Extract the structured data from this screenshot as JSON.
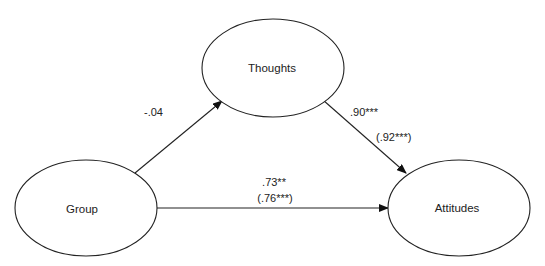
{
  "diagram": {
    "type": "path-mediation-model",
    "nodes": [
      {
        "id": "thoughts",
        "label": "Thoughts",
        "cx": 273,
        "cy": 68,
        "rx": 71,
        "ry": 49
      },
      {
        "id": "group",
        "label": "Group",
        "cx": 86,
        "cy": 208,
        "rx": 71,
        "ry": 48
      },
      {
        "id": "attitudes",
        "label": "Attitudes",
        "cx": 459,
        "cy": 208,
        "rx": 71,
        "ry": 48
      }
    ],
    "edges": [
      {
        "id": "group-to-thoughts",
        "from": "group",
        "to": "thoughts",
        "coefficient": "-.04",
        "coefficient_alt": null
      },
      {
        "id": "thoughts-to-attitudes",
        "from": "thoughts",
        "to": "attitudes",
        "coefficient": ".90***",
        "coefficient_alt": "(.92***)"
      },
      {
        "id": "group-to-attitudes",
        "from": "group",
        "to": "attitudes",
        "coefficient": ".73**",
        "coefficient_alt": "(.76***)"
      }
    ],
    "colors": {
      "stroke": "#222222",
      "fill": "#ffffff",
      "text": "#222222"
    }
  }
}
